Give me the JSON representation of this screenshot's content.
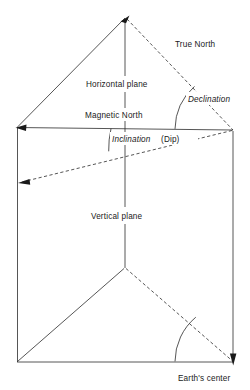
{
  "figure": {
    "background_color": "#ffffff",
    "line_color": "#2b2b2b",
    "text_color": "#1a1a1a",
    "labels": {
      "true_north": "True North",
      "horizontal_plane": "Horizontal plane",
      "magnetic_north": "Magnetic North",
      "declination": "Declination",
      "inclination": "Inclination",
      "dip": "(Dip)",
      "vertical_plane": "Vertical plane",
      "earths_center": "Earth's center"
    },
    "geometry": {
      "top_apex": [
        125,
        17
      ],
      "left_corner": [
        17,
        127
      ],
      "right_corner": [
        233,
        130
      ],
      "bottom_left_corner": [
        17,
        362
      ],
      "bottom_right_corner": [
        233,
        362
      ],
      "lower_apex": [
        125,
        268
      ],
      "dip_arrow_tip": [
        20,
        182
      ],
      "declination_arc_radius": 58,
      "inclination_arc_radius": 94,
      "earth_center_arc_radius": 58
    },
    "arrows": [
      {
        "name": "true-north-arrow",
        "direction": "up-right",
        "at": [
          125,
          17
        ]
      },
      {
        "name": "magnetic-north-arrow",
        "direction": "left",
        "at": [
          17,
          127
        ]
      },
      {
        "name": "inclination-dip-arrow",
        "direction": "left-down",
        "at": [
          20,
          182
        ]
      },
      {
        "name": "earths-center-arrow",
        "direction": "down",
        "at": [
          233,
          362
        ]
      }
    ]
  }
}
